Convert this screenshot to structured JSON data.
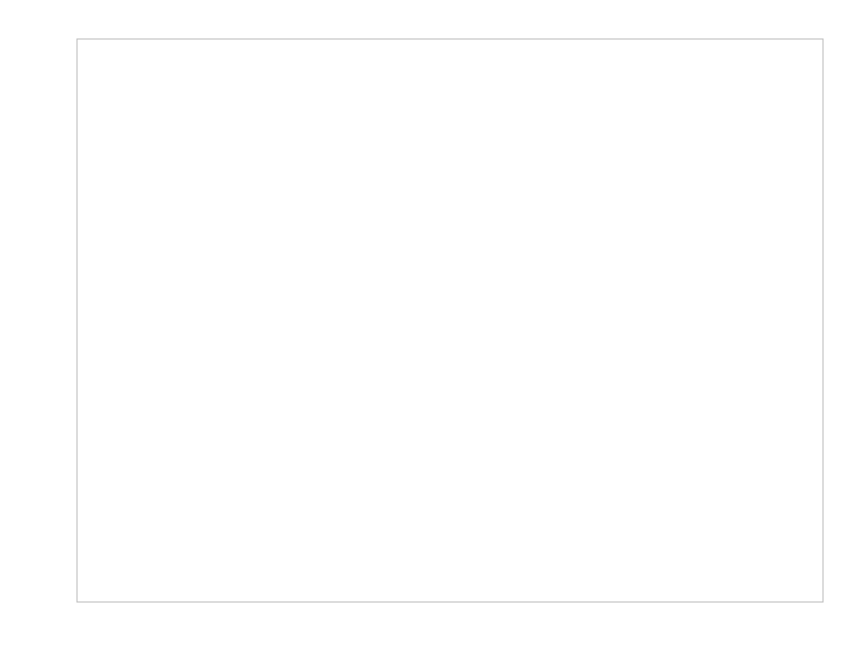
{
  "chart_data": {
    "type": "scatter",
    "title": "",
    "subtitle": "",
    "xlabel": "wt",
    "ylabel": "mpg",
    "xlim": [
      1.34,
      5.64
    ],
    "ylim": [
      7.2,
      35.7
    ],
    "xticks": [
      2,
      3,
      4,
      5
    ],
    "yticks": [
      10,
      20,
      30
    ],
    "xtick_labels": [
      "2",
      "3",
      "4",
      "5"
    ],
    "ytick_labels": [
      "10",
      "20",
      "30"
    ],
    "grid": true,
    "grid_major": true,
    "grid_minor": true,
    "legend": "none",
    "point_color": "#2b2b2b",
    "line_color": "#58585a",
    "ribbon_color": "#d2d2d2",
    "panel_background": "#ffffff",
    "annotations": [],
    "series": [
      {
        "name": "mtcars observations",
        "marker": "filled-circle",
        "points": [
          {
            "x": 1.513,
            "y": 30.4
          },
          {
            "x": 1.615,
            "y": 30.4
          },
          {
            "x": 1.835,
            "y": 33.9
          },
          {
            "x": 1.935,
            "y": 27.3
          },
          {
            "x": 2.14,
            "y": 26.0
          },
          {
            "x": 2.2,
            "y": 32.4
          },
          {
            "x": 2.32,
            "y": 22.8
          },
          {
            "x": 2.465,
            "y": 21.5
          },
          {
            "x": 2.62,
            "y": 21.0
          },
          {
            "x": 2.77,
            "y": 19.7
          },
          {
            "x": 2.78,
            "y": 21.4
          },
          {
            "x": 2.875,
            "y": 21.0
          },
          {
            "x": 3.15,
            "y": 24.4
          },
          {
            "x": 3.17,
            "y": 22.8
          },
          {
            "x": 3.19,
            "y": 15.8
          },
          {
            "x": 3.215,
            "y": 21.4
          },
          {
            "x": 3.44,
            "y": 19.2
          },
          {
            "x": 3.44,
            "y": 18.7
          },
          {
            "x": 3.44,
            "y": 17.8
          },
          {
            "x": 3.46,
            "y": 17.3
          },
          {
            "x": 3.44,
            "y": 15.2
          },
          {
            "x": 3.52,
            "y": 15.5
          },
          {
            "x": 3.57,
            "y": 14.3
          },
          {
            "x": 3.57,
            "y": 15.0
          },
          {
            "x": 3.73,
            "y": 17.3
          },
          {
            "x": 3.78,
            "y": 19.2
          },
          {
            "x": 3.84,
            "y": 15.2
          },
          {
            "x": 3.845,
            "y": 13.3
          },
          {
            "x": 4.07,
            "y": 16.4
          },
          {
            "x": 5.25,
            "y": 10.4
          },
          {
            "x": 5.345,
            "y": 10.4
          },
          {
            "x": 5.424,
            "y": 14.7
          }
        ]
      }
    ],
    "fit": {
      "method": "lm",
      "formula": "mpg ~ wt",
      "intercept": 37.29,
      "slope": -5.34,
      "se_band": "95% confidence",
      "x_start": 1.513,
      "x_end": 5.424,
      "y_start": 29.2,
      "y_end": 8.3
    }
  }
}
